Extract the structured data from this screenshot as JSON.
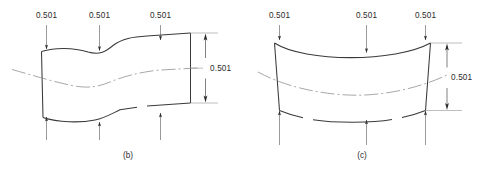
{
  "figure": {
    "background_color": "#ffffff",
    "line_color": "#3a3a3a",
    "text_color": "#2b2b2b",
    "centerline_color": "#8a8a8a"
  },
  "panels": [
    {
      "id": "panel-b",
      "caption": "(b)",
      "top_labels": [
        "0.501",
        "0.501",
        "0.501"
      ],
      "side_dimension": "0.501",
      "shape": "wavy-s-curve-bar",
      "top_arrow_count": 3,
      "bottom_arrow_count": 3,
      "top_arrow_direction": "down",
      "bottom_arrow_direction": "up"
    },
    {
      "id": "panel-c",
      "caption": "(c)",
      "top_labels": [
        "0.501",
        "0.501",
        "0.501"
      ],
      "side_dimension": "0.501",
      "shape": "sagging-arc-bar",
      "top_arrow_count": 3,
      "bottom_arrow_count": 3,
      "top_arrow_direction": "down",
      "bottom_arrow_direction": "up"
    }
  ]
}
